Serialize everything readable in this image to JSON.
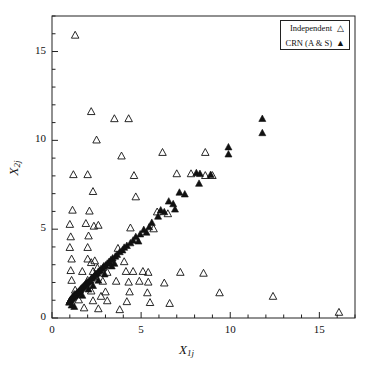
{
  "chart_data": {
    "type": "scatter",
    "title": "",
    "xlabel": "X_1j",
    "ylabel": "X_2j",
    "xlabel_base": "X",
    "xlabel_sub": "1j",
    "ylabel_base": "X",
    "ylabel_sub": "2j",
    "xlim": [
      0,
      17
    ],
    "ylim": [
      0,
      17
    ],
    "xticks": [
      0,
      5,
      10,
      15
    ],
    "yticks": [
      0,
      5,
      10,
      15
    ],
    "xtick_labels": [
      "0",
      "5",
      "10",
      "15"
    ],
    "ytick_labels": [
      "0",
      "5",
      "10",
      "15"
    ],
    "minor_tick_step": 1,
    "grid": false,
    "frame": true,
    "legend_position": "top-right",
    "marker_color": "#111111",
    "series": [
      {
        "name": "Independent",
        "marker": "open-triangle",
        "points": [
          [
            1.3,
            15.9
          ],
          [
            2.2,
            11.6
          ],
          [
            3.5,
            11.2
          ],
          [
            4.3,
            11.2
          ],
          [
            2.5,
            10.0
          ],
          [
            3.9,
            9.1
          ],
          [
            6.2,
            9.3
          ],
          [
            8.6,
            9.3
          ],
          [
            1.2,
            8.05
          ],
          [
            2.0,
            8.05
          ],
          [
            4.6,
            8.0
          ],
          [
            7.0,
            8.1
          ],
          [
            7.8,
            8.1
          ],
          [
            8.6,
            8.0
          ],
          [
            9.0,
            8.0
          ],
          [
            2.3,
            7.1
          ],
          [
            4.7,
            6.8
          ],
          [
            1.15,
            6.05
          ],
          [
            2.1,
            6.0
          ],
          [
            1.0,
            5.25
          ],
          [
            1.9,
            5.3
          ],
          [
            2.6,
            5.2
          ],
          [
            2.35,
            5.15
          ],
          [
            4.4,
            5.05
          ],
          [
            5.7,
            5.0
          ],
          [
            1.05,
            4.55
          ],
          [
            2.05,
            4.6
          ],
          [
            1.0,
            3.95
          ],
          [
            2.0,
            3.95
          ],
          [
            3.7,
            3.9
          ],
          [
            1.1,
            3.3
          ],
          [
            2.0,
            3.3
          ],
          [
            2.4,
            3.2
          ],
          [
            2.2,
            3.1
          ],
          [
            3.3,
            3.15
          ],
          [
            4.05,
            3.15
          ],
          [
            2.55,
            2.8
          ],
          [
            1.05,
            2.65
          ],
          [
            1.7,
            2.6
          ],
          [
            2.3,
            2.6
          ],
          [
            3.1,
            2.55
          ],
          [
            4.15,
            2.6
          ],
          [
            4.55,
            2.6
          ],
          [
            5.1,
            2.6
          ],
          [
            5.4,
            2.55
          ],
          [
            7.2,
            2.55
          ],
          [
            8.5,
            2.5
          ],
          [
            1.1,
            2.1
          ],
          [
            2.0,
            2.1
          ],
          [
            2.85,
            2.05
          ],
          [
            3.6,
            2.05
          ],
          [
            4.3,
            2.0
          ],
          [
            4.9,
            2.05
          ],
          [
            5.4,
            2.0
          ],
          [
            6.3,
            1.95
          ],
          [
            1.3,
            1.55
          ],
          [
            2.2,
            1.5
          ],
          [
            3.0,
            1.45
          ],
          [
            4.35,
            1.45
          ],
          [
            5.35,
            1.4
          ],
          [
            9.4,
            1.4
          ],
          [
            12.4,
            1.2
          ],
          [
            1.5,
            1.0
          ],
          [
            2.3,
            0.95
          ],
          [
            3.1,
            0.95
          ],
          [
            4.2,
            0.9
          ],
          [
            5.5,
            0.85
          ],
          [
            6.6,
            0.8
          ],
          [
            1.8,
            0.55
          ],
          [
            2.6,
            0.5
          ],
          [
            3.8,
            0.45
          ],
          [
            16.1,
            0.3
          ],
          [
            5.9,
            5.95
          ],
          [
            6.5,
            5.85
          ],
          [
            1.25,
            1.3
          ],
          [
            2.75,
            1.2
          ]
        ]
      },
      {
        "name": "CRN (A & S)",
        "marker": "filled-triangle",
        "points": [
          [
            11.8,
            11.2
          ],
          [
            11.8,
            10.4
          ],
          [
            9.9,
            9.6
          ],
          [
            9.9,
            9.2
          ],
          [
            8.1,
            8.15
          ],
          [
            8.3,
            8.1
          ],
          [
            8.9,
            8.05
          ],
          [
            8.25,
            7.55
          ],
          [
            7.15,
            7.05
          ],
          [
            7.45,
            6.95
          ],
          [
            6.55,
            6.55
          ],
          [
            6.8,
            6.4
          ],
          [
            6.1,
            6.05
          ],
          [
            6.3,
            5.95
          ],
          [
            5.95,
            5.7
          ],
          [
            5.6,
            5.35
          ],
          [
            5.45,
            5.1
          ],
          [
            5.15,
            4.95
          ],
          [
            4.95,
            4.7
          ],
          [
            4.7,
            4.55
          ],
          [
            4.55,
            4.35
          ],
          [
            4.4,
            4.2
          ],
          [
            4.2,
            4.05
          ],
          [
            4.05,
            3.95
          ],
          [
            3.95,
            3.8
          ],
          [
            3.8,
            3.7
          ],
          [
            3.65,
            3.55
          ],
          [
            3.55,
            3.45
          ],
          [
            3.4,
            3.35
          ],
          [
            3.3,
            3.25
          ],
          [
            3.2,
            3.15
          ],
          [
            3.1,
            3.05
          ],
          [
            3.0,
            2.95
          ],
          [
            2.9,
            2.9
          ],
          [
            2.85,
            2.8
          ],
          [
            2.75,
            2.75
          ],
          [
            2.7,
            2.65
          ],
          [
            2.6,
            2.6
          ],
          [
            2.55,
            2.5
          ],
          [
            2.45,
            2.45
          ],
          [
            2.4,
            2.4
          ],
          [
            2.35,
            2.3
          ],
          [
            2.25,
            2.25
          ],
          [
            2.2,
            2.2
          ],
          [
            2.15,
            2.1
          ],
          [
            2.1,
            2.05
          ],
          [
            2.0,
            2.0
          ],
          [
            1.95,
            1.95
          ],
          [
            1.9,
            1.9
          ],
          [
            1.85,
            1.85
          ],
          [
            1.8,
            1.8
          ],
          [
            1.75,
            1.75
          ],
          [
            1.7,
            1.7
          ],
          [
            1.65,
            1.65
          ],
          [
            1.6,
            1.6
          ],
          [
            1.58,
            1.55
          ],
          [
            1.52,
            1.5
          ],
          [
            1.48,
            1.45
          ],
          [
            1.44,
            1.42
          ],
          [
            1.4,
            1.38
          ],
          [
            1.36,
            1.34
          ],
          [
            1.32,
            1.3
          ],
          [
            1.28,
            1.26
          ],
          [
            1.24,
            1.22
          ],
          [
            1.2,
            1.18
          ],
          [
            1.16,
            1.14
          ],
          [
            1.12,
            1.1
          ],
          [
            1.08,
            1.06
          ],
          [
            1.05,
            1.02
          ],
          [
            1.02,
            0.98
          ],
          [
            1.0,
            0.94
          ],
          [
            0.98,
            0.9
          ],
          [
            0.96,
            0.86
          ],
          [
            1.1,
            0.7
          ],
          [
            1.25,
            0.62
          ],
          [
            2.6,
            2.1
          ],
          [
            2.95,
            2.45
          ],
          [
            3.35,
            2.9
          ],
          [
            2.05,
            1.6
          ],
          [
            1.7,
            1.25
          ],
          [
            2.3,
            1.8
          ],
          [
            4.85,
            4.3
          ],
          [
            5.3,
            4.8
          ],
          [
            3.5,
            3.05
          ],
          [
            6.9,
            6.1
          ]
        ]
      }
    ]
  },
  "legend": {
    "entries": [
      {
        "label": "Independent",
        "marker": "△"
      },
      {
        "label": "CRN (A & S)",
        "marker": "▲"
      }
    ]
  }
}
